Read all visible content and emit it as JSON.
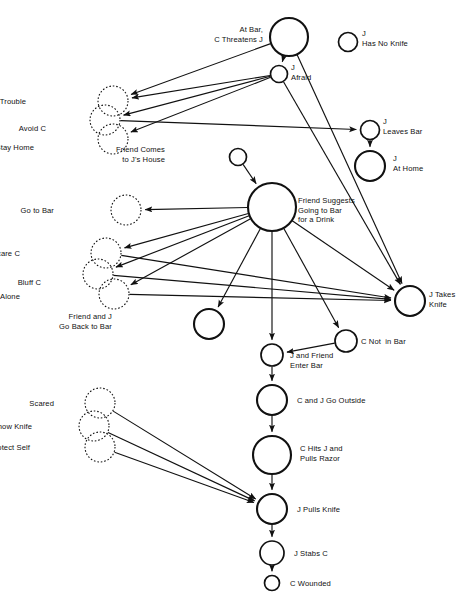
{
  "diagram": {
    "type": "flow-network-diagram",
    "width": 464,
    "height": 605,
    "stroke_color": "#111111",
    "background_color": "#ffffff",
    "nodes": [
      {
        "id": "at-bar-c-threatens-j",
        "label": "At Bar,\nC Threatens J",
        "cx": 289,
        "cy": 37,
        "r": 19,
        "style": "solid",
        "label_pos": "left",
        "label_x": 263,
        "label_y": 25
      },
      {
        "id": "j-has-no-knife",
        "label": "J\nHas No Knife",
        "cx": 348,
        "cy": 42,
        "r": 9.5,
        "style": "solid",
        "label_pos": "right",
        "label_x": 362,
        "label_y": 29
      },
      {
        "id": "j-afraid",
        "label": "J\nAfraid",
        "cx": 279,
        "cy": 74,
        "r": 8.5,
        "style": "solid",
        "label_pos": "right",
        "label_x": 291,
        "label_y": 63
      },
      {
        "id": "avoid-trouble",
        "label": "Avoid Trouble",
        "cx": 113,
        "cy": 101,
        "r": 15,
        "style": "dashed",
        "label_pos": "left",
        "label_x": 26,
        "label_y": 97
      },
      {
        "id": "avoid-c",
        "label": "Avoid C",
        "cx": 105,
        "cy": 120,
        "r": 15,
        "style": "dashed",
        "label_pos": "left",
        "label_x": 46,
        "label_y": 124
      },
      {
        "id": "stay-home",
        "label": "Stay Home",
        "cx": 113,
        "cy": 139,
        "r": 15,
        "style": "dashed",
        "label_pos": "left",
        "label_x": 34,
        "label_y": 143
      },
      {
        "id": "j-leaves-bar",
        "label": "J\nLeaves Bar",
        "cx": 370,
        "cy": 130,
        "r": 9.5,
        "style": "solid",
        "label_pos": "right",
        "label_x": 383,
        "label_y": 117
      },
      {
        "id": "j-at-home",
        "label": "J\nAt Home",
        "cx": 370,
        "cy": 166,
        "r": 15,
        "style": "solid",
        "label_pos": "right",
        "label_x": 393,
        "label_y": 154
      },
      {
        "id": "friend-comes-to-js-house",
        "label": "Friend Comes\nto J's House",
        "cx": 238,
        "cy": 157,
        "r": 8.5,
        "style": "solid",
        "label_pos": "left",
        "label_x": 165,
        "label_y": 145
      },
      {
        "id": "friend-suggests-going-to-bar",
        "label": "Friend Suggests\nGoing to Bar\nfor a Drink",
        "cx": 272,
        "cy": 207,
        "r": 24,
        "style": "solid",
        "label_pos": "right",
        "label_x": 298,
        "label_y": 196
      },
      {
        "id": "go-to-bar",
        "label": "Go to Bar",
        "cx": 126,
        "cy": 210,
        "r": 15,
        "style": "dashed",
        "label_pos": "left",
        "label_x": 54,
        "label_y": 206
      },
      {
        "id": "scare-c",
        "label": "Scare C",
        "cx": 106,
        "cy": 253,
        "r": 15,
        "style": "dashed",
        "label_pos": "left",
        "label_x": 20,
        "label_y": 249
      },
      {
        "id": "bluff-c",
        "label": "Bluff C",
        "cx": 98,
        "cy": 274,
        "r": 15,
        "style": "dashed",
        "label_pos": "left",
        "label_x": 41,
        "label_y": 278
      },
      {
        "id": "c-leaves-j-alone",
        "label": "C Leaves J Alone",
        "cx": 114,
        "cy": 294,
        "r": 15,
        "style": "dashed",
        "label_pos": "left",
        "label_x": 20,
        "label_y": 292
      },
      {
        "id": "j-takes-knife",
        "label": "J Takes\nKnife",
        "cx": 410,
        "cy": 301,
        "r": 15,
        "style": "solid",
        "label_pos": "right",
        "label_x": 429,
        "label_y": 290
      },
      {
        "id": "friend-and-j-go-back-to-bar",
        "label": "Friend and J\nGo Back to Bar",
        "cx": 209,
        "cy": 324,
        "r": 15,
        "style": "solid",
        "label_pos": "left",
        "label_x": 112,
        "label_y": 312
      },
      {
        "id": "c-not-in-bar",
        "label": "C Not  in Bar",
        "cx": 346,
        "cy": 341,
        "r": 11,
        "style": "solid",
        "label_pos": "right",
        "label_x": 361,
        "label_y": 337
      },
      {
        "id": "j-and-friend-enter-bar",
        "label": "J and Friend\nEnter Bar",
        "cx": 272,
        "cy": 355,
        "r": 11,
        "style": "solid",
        "label_pos": "right",
        "label_x": 290,
        "label_y": 351
      },
      {
        "id": "c-and-j-go-outside",
        "label": "C and J Go Outside",
        "cx": 272,
        "cy": 400,
        "r": 15,
        "style": "solid",
        "label_pos": "right",
        "label_x": 297,
        "label_y": 396
      },
      {
        "id": "scared",
        "label": "Scared",
        "cx": 100,
        "cy": 403,
        "r": 15,
        "style": "dashed",
        "label_pos": "left",
        "label_x": 54,
        "label_y": 399
      },
      {
        "id": "show-knife",
        "label": "Show Knife",
        "cx": 94,
        "cy": 426,
        "r": 15,
        "style": "dashed",
        "label_pos": "left",
        "label_x": 32,
        "label_y": 422
      },
      {
        "id": "protect-self",
        "label": "Protect Self",
        "cx": 100,
        "cy": 447,
        "r": 15,
        "style": "dashed",
        "label_pos": "left",
        "label_x": 30,
        "label_y": 443
      },
      {
        "id": "c-hits-j-and-pulls-razor",
        "label": "C Hits J and\nPulls Razor",
        "cx": 272,
        "cy": 455,
        "r": 19,
        "style": "solid",
        "label_pos": "right",
        "label_x": 300,
        "label_y": 444
      },
      {
        "id": "j-pulls-knife",
        "label": "J Pulls Knife",
        "cx": 272,
        "cy": 509,
        "r": 15,
        "style": "solid",
        "label_pos": "right",
        "label_x": 297,
        "label_y": 505
      },
      {
        "id": "j-stabs-c",
        "label": "J Stabs C",
        "cx": 272,
        "cy": 553,
        "r": 12,
        "style": "solid",
        "label_pos": "right",
        "label_x": 294,
        "label_y": 549
      },
      {
        "id": "c-wounded",
        "label": "C Wounded",
        "cx": 272,
        "cy": 583,
        "r": 7.5,
        "style": "solid",
        "label_pos": "right",
        "label_x": 290,
        "label_y": 579
      }
    ],
    "edges": [
      {
        "from": "at-bar-c-threatens-j",
        "to": "j-afraid"
      },
      {
        "from": "at-bar-c-threatens-j",
        "to": "avoid-trouble"
      },
      {
        "from": "at-bar-c-threatens-j",
        "to": "j-takes-knife"
      },
      {
        "from": "j-afraid",
        "to": "avoid-trouble"
      },
      {
        "from": "j-afraid",
        "to": "avoid-c"
      },
      {
        "from": "j-afraid",
        "to": "stay-home"
      },
      {
        "from": "j-afraid",
        "to": "j-takes-knife"
      },
      {
        "from": "avoid-c",
        "to": "j-leaves-bar"
      },
      {
        "from": "j-leaves-bar",
        "to": "j-at-home"
      },
      {
        "from": "friend-comes-to-js-house",
        "to": "friend-suggests-going-to-bar"
      },
      {
        "from": "friend-suggests-going-to-bar",
        "to": "go-to-bar"
      },
      {
        "from": "friend-suggests-going-to-bar",
        "to": "scare-c"
      },
      {
        "from": "friend-suggests-going-to-bar",
        "to": "bluff-c"
      },
      {
        "from": "friend-suggests-going-to-bar",
        "to": "c-leaves-j-alone"
      },
      {
        "from": "friend-suggests-going-to-bar",
        "to": "friend-and-j-go-back-to-bar"
      },
      {
        "from": "friend-suggests-going-to-bar",
        "to": "j-and-friend-enter-bar"
      },
      {
        "from": "friend-suggests-going-to-bar",
        "to": "c-not-in-bar"
      },
      {
        "from": "friend-suggests-going-to-bar",
        "to": "j-takes-knife"
      },
      {
        "from": "scare-c",
        "to": "j-takes-knife"
      },
      {
        "from": "bluff-c",
        "to": "j-takes-knife"
      },
      {
        "from": "c-leaves-j-alone",
        "to": "j-takes-knife"
      },
      {
        "from": "c-not-in-bar",
        "to": "j-and-friend-enter-bar"
      },
      {
        "from": "j-and-friend-enter-bar",
        "to": "c-and-j-go-outside"
      },
      {
        "from": "c-and-j-go-outside",
        "to": "c-hits-j-and-pulls-razor"
      },
      {
        "from": "c-hits-j-and-pulls-razor",
        "to": "j-pulls-knife"
      },
      {
        "from": "scared",
        "to": "j-pulls-knife"
      },
      {
        "from": "show-knife",
        "to": "j-pulls-knife"
      },
      {
        "from": "protect-self",
        "to": "j-pulls-knife"
      },
      {
        "from": "j-pulls-knife",
        "to": "j-stabs-c"
      },
      {
        "from": "j-stabs-c",
        "to": "c-wounded"
      }
    ]
  }
}
